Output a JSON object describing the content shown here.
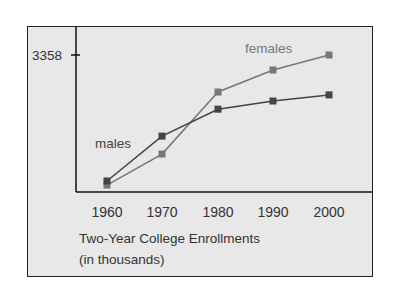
{
  "chart_data": {
    "type": "line",
    "xlabel": "",
    "ylabel": "",
    "categories": [
      "1960",
      "1970",
      "1980",
      "1990",
      "2000"
    ],
    "y_tick_labels": [
      "3358"
    ],
    "ylim": [
      0,
      3358
    ],
    "grid": false,
    "legend_position": "inline labels",
    "series": [
      {
        "name": "females",
        "color": "#777777",
        "marker": "square",
        "values": [
          170,
          930,
          2450,
          2990,
          3358
        ]
      },
      {
        "name": "males",
        "color": "#444444",
        "marker": "square",
        "values": [
          270,
          1370,
          2030,
          2230,
          2380
        ]
      }
    ]
  },
  "labels": {
    "y_tick": "3358",
    "females": "females",
    "males": "males",
    "caption_line1": "Two-Year College Enrollments",
    "caption_line2": "(in thousands)"
  }
}
